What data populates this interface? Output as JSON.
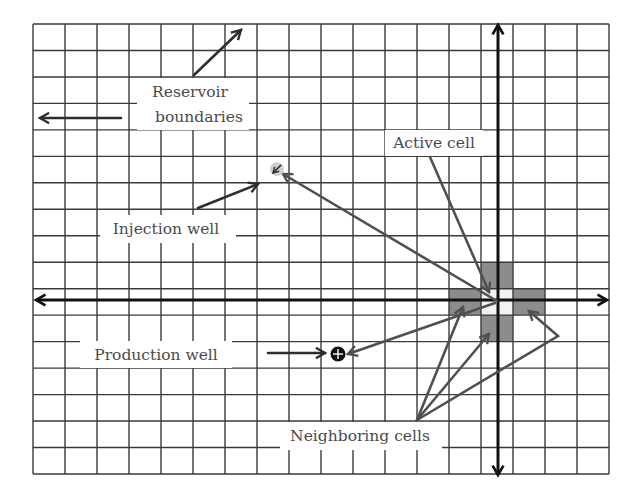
{
  "figure": {
    "width": 638,
    "height": 495,
    "background": "#ffffff"
  },
  "grid": {
    "x0": 33,
    "y0": 24,
    "cols": 18,
    "rows": 17,
    "cell_w": 32.0,
    "cell_h": 26.47,
    "line_color": "#3a3a3a"
  },
  "axes": {
    "horizontal": {
      "y": 300,
      "x_start": 36,
      "x_end": 607,
      "arrows": "both"
    },
    "vertical": {
      "x": 498,
      "y_start": 25,
      "y_end": 475,
      "arrows": "both"
    },
    "color": "#111111"
  },
  "cells": {
    "shade_color": "#8c8c8c",
    "active": {
      "x": 481,
      "y": 289,
      "w": 32,
      "h": 26,
      "color": "#f2f2f2",
      "name": "active-cell"
    },
    "neighbors": [
      {
        "name": "neighbor-cell-north",
        "x": 481,
        "y": 263,
        "w": 32,
        "h": 26
      },
      {
        "name": "neighbor-cell-west",
        "x": 449,
        "y": 289,
        "w": 32,
        "h": 26
      },
      {
        "name": "neighbor-cell-east",
        "x": 513,
        "y": 289,
        "w": 32,
        "h": 26
      },
      {
        "name": "neighbor-cell-south",
        "x": 481,
        "y": 315,
        "w": 32,
        "h": 26
      }
    ]
  },
  "wells": {
    "injection": {
      "x": 277,
      "y": 169,
      "r": 7,
      "fill": "#cfcfcf"
    },
    "production": {
      "x": 338,
      "y": 354,
      "r": 7.5,
      "fill": "#111111"
    }
  },
  "labels": [
    {
      "id": "reservoir-boundaries",
      "lines": [
        "Reservoir",
        "boundaries"
      ],
      "box": [
        137,
        78,
        112,
        52
      ],
      "text_x": [
        190,
        199
      ],
      "text_y": [
        97,
        122
      ]
    },
    {
      "id": "active-cell",
      "lines": [
        "Active cell"
      ],
      "box": [
        385,
        130,
        98,
        26
      ],
      "text_x": [
        434
      ],
      "text_y": [
        148
      ]
    },
    {
      "id": "injection-well",
      "lines": [
        "Injection well"
      ],
      "box": [
        100,
        215,
        136,
        28
      ],
      "text_x": [
        166
      ],
      "text_y": [
        234
      ]
    },
    {
      "id": "production-well",
      "lines": [
        "Production well"
      ],
      "box": [
        80,
        341,
        152,
        27
      ],
      "text_x": [
        156
      ],
      "text_y": [
        360
      ]
    },
    {
      "id": "neighboring-cells",
      "lines": [
        "Neighboring cells"
      ],
      "box": [
        280,
        422,
        162,
        28
      ],
      "text_x": [
        360
      ],
      "text_y": [
        441
      ]
    }
  ],
  "pointers": [
    {
      "name": "boundary-arrow-northeast",
      "points": [
        [
          194,
          75
        ],
        [
          241,
          30
        ]
      ],
      "style": "dark"
    },
    {
      "name": "boundary-arrow-west",
      "points": [
        [
          121,
          118
        ],
        [
          40,
          118
        ]
      ],
      "style": "dark"
    },
    {
      "name": "active-cell-pointer",
      "points": [
        [
          430,
          157
        ],
        [
          489,
          292
        ]
      ],
      "style": "grey"
    },
    {
      "name": "injection-well-pointer",
      "points": [
        [
          198,
          208
        ],
        [
          258,
          184
        ]
      ],
      "style": "dark"
    },
    {
      "name": "flow-to-injection-well",
      "points": [
        [
          497,
          301
        ],
        [
          283,
          174
        ]
      ],
      "style": "grey"
    },
    {
      "name": "production-well-pointer",
      "points": [
        [
          268,
          353
        ],
        [
          325,
          353
        ]
      ],
      "style": "dark"
    },
    {
      "name": "flow-to-production-well",
      "points": [
        [
          495,
          303
        ],
        [
          348,
          354
        ]
      ],
      "style": "grey"
    },
    {
      "name": "neighbor-pointer-west",
      "points": [
        [
          417,
          420
        ],
        [
          463,
          307
        ]
      ],
      "style": "grey"
    },
    {
      "name": "neighbor-pointer-south",
      "points": [
        [
          417,
          420
        ],
        [
          489,
          334
        ]
      ],
      "style": "grey"
    },
    {
      "name": "neighbor-pointer-east",
      "points": [
        [
          417,
          420
        ],
        [
          558,
          336
        ],
        [
          529,
          311
        ]
      ],
      "style": "grey"
    }
  ]
}
